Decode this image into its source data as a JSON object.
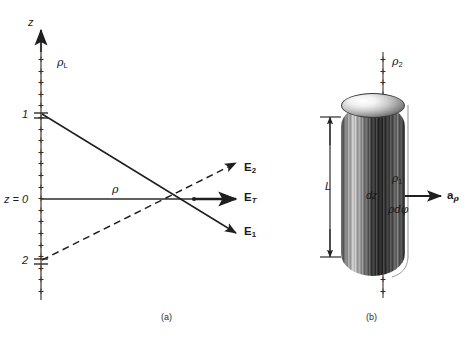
{
  "figure": {
    "panels": [
      {
        "id": "a",
        "caption": "(a)",
        "axis_vertical_label": "z",
        "axis_horizontal_label": "ρ",
        "charge_density_label": "ρ",
        "charge_density_subscript": "L",
        "origin_label": "z = 0",
        "tick_labels": [
          "1",
          "2"
        ],
        "plus_symbol": "+",
        "vectors": [
          {
            "name": "E2",
            "symbol": "E",
            "subscript": "2",
            "style": "dashed",
            "direction": "up-right"
          },
          {
            "name": "ET",
            "symbol": "E",
            "subscript": "T",
            "style": "solid",
            "direction": "right"
          },
          {
            "name": "E1",
            "symbol": "E",
            "subscript": "1",
            "style": "solid",
            "direction": "down-right"
          }
        ]
      },
      {
        "id": "b",
        "caption": "(b)",
        "length_label": "L",
        "outer_density_label": "ρ",
        "outer_density_subscript": "2",
        "inner_density_label": "ρ",
        "inner_density_subscript": "1",
        "element_height_label": "dz",
        "element_width_label": "ρdφ",
        "unit_vector_symbol": "a",
        "unit_vector_subscript": "ρ",
        "plus_symbol": "+"
      }
    ]
  },
  "colors": {
    "ink": "#1a1a1a",
    "line": "#3a3a3a",
    "plus": "#2e2e2e",
    "background": "#ffffff"
  }
}
